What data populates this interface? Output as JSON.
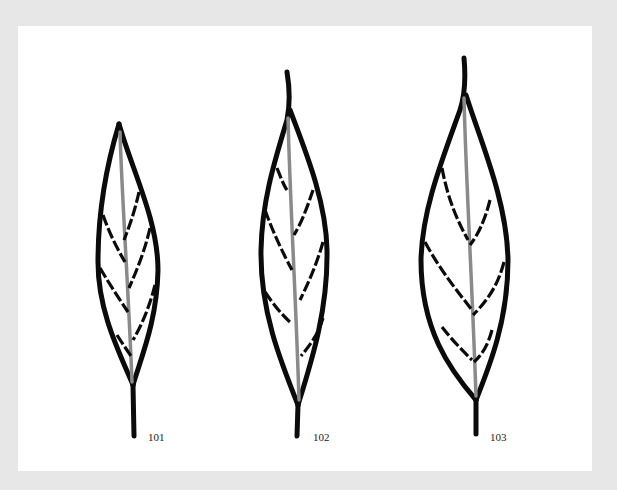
{
  "figure": {
    "background_color": "#e7e7e7",
    "panel_color": "#ffffff",
    "outline_color": "#0b0b0b",
    "midrib_color": "#8a8a8a",
    "leaves": [
      {
        "id": "leaf-101",
        "label": "101",
        "shape": "narrow lanceolate leaf with dashed lateral veins"
      },
      {
        "id": "leaf-102",
        "label": "102",
        "shape": "lanceolate leaf with dashed lateral veins"
      },
      {
        "id": "leaf-103",
        "label": "103",
        "shape": "broad lanceolate leaf with dashed lateral veins"
      }
    ]
  }
}
